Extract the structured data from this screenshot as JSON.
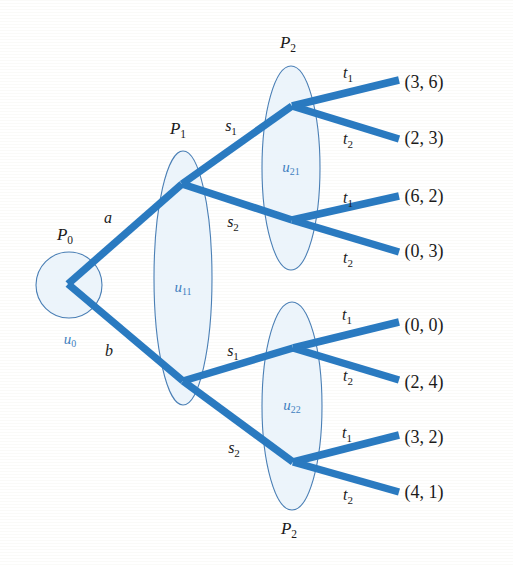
{
  "figure": {
    "width": 513,
    "height": 566,
    "background_color": "#fdfdfc",
    "branch_color": "#2a7ac0",
    "infoset_fill": "#e9f2fa",
    "infoset_stroke": "#4a7fb5",
    "uset_text_color": "#3f7fc0",
    "text_color": "#1a1a1a"
  },
  "players": {
    "root": {
      "name": "P",
      "sub": "0"
    },
    "p1": {
      "name": "P",
      "sub": "1"
    },
    "p2_top": {
      "name": "P",
      "sub": "2"
    },
    "p2_bottom": {
      "name": "P",
      "sub": "2"
    }
  },
  "information_sets": [
    {
      "id": "u0",
      "name": "u",
      "sub": "0",
      "shape": "circle",
      "cx": 69,
      "cy": 285,
      "r": 33,
      "owner": "P0"
    },
    {
      "id": "u11",
      "name": "u",
      "sub": "11",
      "shape": "ellipse",
      "cx": 183,
      "cy": 278,
      "rx": 29,
      "ry": 127,
      "owner": "P1"
    },
    {
      "id": "u21",
      "name": "u",
      "sub": "21",
      "shape": "ellipse",
      "cx": 291,
      "cy": 168,
      "rx": 29,
      "ry": 102,
      "owner": "P2"
    },
    {
      "id": "u22",
      "name": "u",
      "sub": "22",
      "shape": "ellipse",
      "cx": 292,
      "cy": 406,
      "rx": 30,
      "ry": 104,
      "owner": "P2"
    }
  ],
  "actions": {
    "root": [
      {
        "label": "a",
        "sub": "",
        "x": 108,
        "y": 223
      },
      {
        "label": "b",
        "sub": "",
        "x": 109,
        "y": 356
      }
    ],
    "p1_top": [
      {
        "label": "s",
        "sub": "1",
        "x": 231,
        "y": 131
      },
      {
        "label": "s",
        "sub": "2",
        "x": 233,
        "y": 227
      }
    ],
    "p1_bottom": [
      {
        "label": "s",
        "sub": "1",
        "x": 233,
        "y": 356
      },
      {
        "label": "s",
        "sub": "2",
        "x": 234,
        "y": 453
      }
    ],
    "p2_terminal": [
      {
        "label": "t",
        "sub": "1",
        "x": 348,
        "y": 78
      },
      {
        "label": "t",
        "sub": "2",
        "x": 348,
        "y": 144
      },
      {
        "label": "t",
        "sub": "1",
        "x": 348,
        "y": 203
      },
      {
        "label": "t",
        "sub": "2",
        "x": 348,
        "y": 263
      },
      {
        "label": "t",
        "sub": "1",
        "x": 347,
        "y": 320
      },
      {
        "label": "t",
        "sub": "2",
        "x": 348,
        "y": 381
      },
      {
        "label": "t",
        "sub": "1",
        "x": 347,
        "y": 438
      },
      {
        "label": "t",
        "sub": "2",
        "x": 348,
        "y": 500
      }
    ]
  },
  "player_headers": [
    {
      "name": "P",
      "sub": "1",
      "x": 178,
      "y": 134
    },
    {
      "name": "P",
      "sub": "2",
      "x": 288,
      "y": 48
    },
    {
      "name": "P",
      "sub": "0",
      "x": 65,
      "y": 240
    },
    {
      "name": "P",
      "sub": "2",
      "x": 289,
      "y": 534
    }
  ],
  "payoffs": [
    {
      "text": "(3, 6)",
      "x": 424,
      "y": 88,
      "p1": 3,
      "p2": 6,
      "path": "a-s1-t1"
    },
    {
      "text": "(2, 3)",
      "x": 424,
      "y": 144,
      "p1": 2,
      "p2": 3,
      "path": "a-s1-t2"
    },
    {
      "text": "(6, 2)",
      "x": 424,
      "y": 202,
      "p1": 6,
      "p2": 2,
      "path": "a-s2-t1"
    },
    {
      "text": "(0, 3)",
      "x": 424,
      "y": 257,
      "p1": 0,
      "p2": 3,
      "path": "a-s2-t2"
    },
    {
      "text": "(0, 0)",
      "x": 424,
      "y": 331,
      "p1": 0,
      "p2": 0,
      "path": "b-s1-t1"
    },
    {
      "text": "(2, 4)",
      "x": 424,
      "y": 388,
      "p1": 2,
      "p2": 4,
      "path": "b-s1-t2"
    },
    {
      "text": "(3, 2)",
      "x": 424,
      "y": 443,
      "p1": 3,
      "p2": 2,
      "path": "b-s2-t1"
    },
    {
      "text": "(4, 1)",
      "x": 424,
      "y": 498,
      "p1": 4,
      "p2": 1,
      "path": "b-s2-t2"
    }
  ],
  "nodes": {
    "root": {
      "x": 68,
      "y": 284
    },
    "p1_top": {
      "x": 182,
      "y": 184
    },
    "p1_bottom": {
      "x": 183,
      "y": 381
    },
    "p2_a": {
      "x": 292,
      "y": 106
    },
    "p2_b": {
      "x": 292,
      "y": 220
    },
    "p2_c": {
      "x": 293,
      "y": 348
    },
    "p2_d": {
      "x": 293,
      "y": 462
    }
  },
  "branches": [
    {
      "name": "root-a",
      "x1": 68,
      "y1": 284,
      "x2": 182,
      "y2": 184
    },
    {
      "name": "root-b",
      "x1": 68,
      "y1": 284,
      "x2": 183,
      "y2": 381
    },
    {
      "name": "p1t-s1",
      "x1": 182,
      "y1": 184,
      "x2": 292,
      "y2": 106
    },
    {
      "name": "p1t-s2",
      "x1": 182,
      "y1": 184,
      "x2": 292,
      "y2": 220
    },
    {
      "name": "p1b-s1",
      "x1": 183,
      "y1": 381,
      "x2": 293,
      "y2": 348
    },
    {
      "name": "p1b-s2",
      "x1": 183,
      "y1": 381,
      "x2": 293,
      "y2": 462
    },
    {
      "name": "t1-1",
      "x1": 292,
      "y1": 106,
      "x2": 399,
      "y2": 80
    },
    {
      "name": "t2-1",
      "x1": 292,
      "y1": 106,
      "x2": 399,
      "y2": 139
    },
    {
      "name": "t1-2",
      "x1": 292,
      "y1": 220,
      "x2": 399,
      "y2": 196
    },
    {
      "name": "t2-2",
      "x1": 292,
      "y1": 220,
      "x2": 399,
      "y2": 252
    },
    {
      "name": "t1-3",
      "x1": 293,
      "y1": 348,
      "x2": 399,
      "y2": 322
    },
    {
      "name": "t2-3",
      "x1": 293,
      "y1": 348,
      "x2": 399,
      "y2": 380
    },
    {
      "name": "t1-4",
      "x1": 293,
      "y1": 462,
      "x2": 399,
      "y2": 435
    },
    {
      "name": "t2-4",
      "x1": 293,
      "y1": 462,
      "x2": 399,
      "y2": 492
    }
  ]
}
